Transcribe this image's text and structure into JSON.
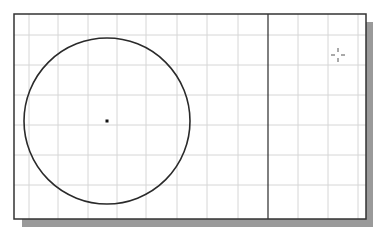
{
  "drawing_area": {
    "frame": {
      "x": 14,
      "y": 14,
      "width": 352,
      "height": 205
    },
    "background": "#ffffff",
    "frame_color": "#333333",
    "shadow_color": "#9a9a9a",
    "grid": {
      "color": "#d6d6d6",
      "vertical_x": [
        29,
        58,
        88,
        117,
        146,
        177,
        207,
        238,
        298,
        328,
        358
      ],
      "horizontal_y": [
        35,
        65,
        95,
        125,
        155,
        185
      ]
    }
  },
  "entities": {
    "circle": {
      "cx": 107,
      "cy": 121,
      "r": 83,
      "stroke": "#2a2a2a"
    },
    "center_point": {
      "x": 107,
      "y": 121
    },
    "vertical_line": {
      "x": 268,
      "y1": 14,
      "y2": 219,
      "stroke": "#2a2a2a"
    }
  },
  "cursor": {
    "type": "crosshair-icon",
    "x": 338,
    "y": 55
  }
}
